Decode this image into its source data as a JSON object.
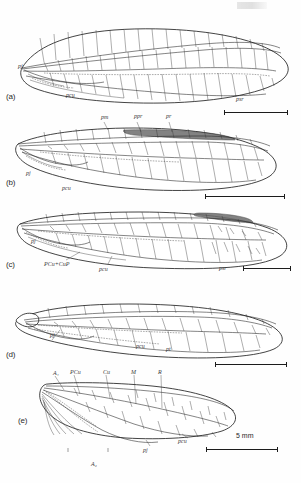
{
  "figure": {
    "caption_marks": [
      "(a)",
      "(b)",
      "(c)",
      "(d)",
      "(e)"
    ],
    "scale_text": "5 mm"
  },
  "panels": [
    {
      "id": "a",
      "label": "(a)",
      "labels": [
        {
          "text": "pj",
          "x": 18,
          "y": 68
        },
        {
          "text": "pcu",
          "x": 66,
          "y": 97
        },
        {
          "text": "psr",
          "x": 236,
          "y": 101
        }
      ]
    },
    {
      "id": "b",
      "label": "(b)",
      "labels": [
        {
          "text": "pm",
          "x": 101,
          "y": 119
        },
        {
          "text": "ppr",
          "x": 134,
          "y": 118
        },
        {
          "text": "pr",
          "x": 166,
          "y": 118
        },
        {
          "text": "pj",
          "x": 26,
          "y": 175
        },
        {
          "text": "pcu",
          "x": 62,
          "y": 190
        }
      ]
    },
    {
      "id": "c",
      "label": "(c)",
      "labels": [
        {
          "text": "pj",
          "x": 31,
          "y": 243
        },
        {
          "text": "PCu+CuP",
          "x": 44,
          "y": 266
        },
        {
          "text": "pcu",
          "x": 99,
          "y": 271
        },
        {
          "text": "psr",
          "x": 219,
          "y": 270
        }
      ]
    },
    {
      "id": "d",
      "label": "(d)",
      "labels": [
        {
          "text": "pj",
          "x": 50,
          "y": 337
        },
        {
          "text": "pcu",
          "x": 136,
          "y": 348
        },
        {
          "text": "pt",
          "x": 166,
          "y": 351
        }
      ]
    },
    {
      "id": "e",
      "label": "(e)",
      "labels": [
        {
          "text": "A₁",
          "x": 53,
          "y": 376
        },
        {
          "text": "PCu",
          "x": 70,
          "y": 375
        },
        {
          "text": "Cu",
          "x": 103,
          "y": 375
        },
        {
          "text": "M",
          "x": 131,
          "y": 375
        },
        {
          "text": "R",
          "x": 158,
          "y": 375
        },
        {
          "text": "A₂",
          "x": 91,
          "y": 466
        },
        {
          "text": "pj",
          "x": 143,
          "y": 452
        },
        {
          "text": "pcu",
          "x": 178,
          "y": 443
        }
      ]
    }
  ],
  "scalebars": [
    {
      "id": "scale-a",
      "x": 224,
      "y": 112,
      "w": 64
    },
    {
      "id": "scale-b",
      "x": 205,
      "y": 196,
      "w": 80
    },
    {
      "id": "scale-c",
      "x": 243,
      "y": 268,
      "w": 48
    },
    {
      "id": "scale-d",
      "x": 215,
      "y": 364,
      "w": 72
    },
    {
      "id": "scale-e",
      "x": 206,
      "y": 449,
      "w": 72
    }
  ],
  "colors": {
    "ink": "#1f1f1f",
    "stigma": "#6d6d6d",
    "paper": "#ffffff"
  }
}
